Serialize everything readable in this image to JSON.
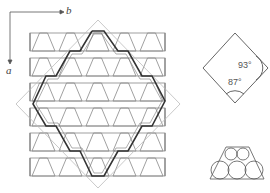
{
  "axes": {
    "x_label": "b",
    "y_label": "a"
  },
  "lattice": {
    "rows": 6,
    "cell_shape": "trapezoid (truncated triangle)",
    "outline_hexagon": "dark stepped outline",
    "unit_cell": "dashed rhombus"
  },
  "rhombus_detail": {
    "angle_right": "93°",
    "angle_bottom": "87°"
  },
  "packing_detail": {
    "shape": "trapezoid with packed circles"
  },
  "colors": {
    "line": "#777777",
    "dark_line": "#333333",
    "dashed": "#aaaaaa"
  }
}
